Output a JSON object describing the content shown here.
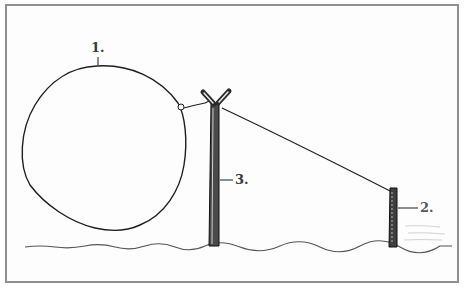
{
  "diagram": {
    "labels": {
      "balloon": "1.",
      "short_post": "2.",
      "tall_pole": "3."
    },
    "colors": {
      "ink": "#1e1e1e",
      "frame": "#8f8f8f",
      "background": "#ffffff"
    }
  }
}
